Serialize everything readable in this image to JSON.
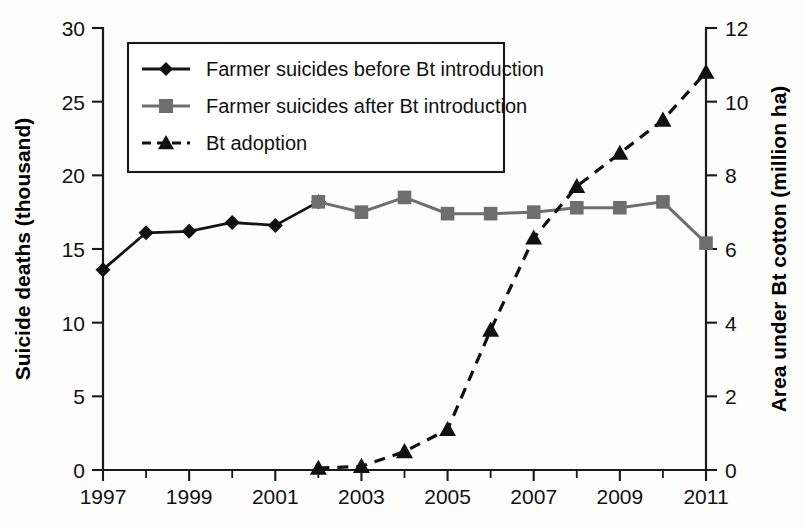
{
  "chart_data": {
    "type": "line",
    "title": "",
    "xlabel": "",
    "ylabel": "Suicide deaths (thousand)",
    "y2label": "Area under Bt cotton (million ha)",
    "x": [
      1997,
      1998,
      1999,
      2000,
      2001,
      2002,
      2003,
      2004,
      2005,
      2006,
      2007,
      2008,
      2009,
      2010,
      2011
    ],
    "xlim": [
      1997,
      2011
    ],
    "ylim": [
      0,
      30
    ],
    "y2lim": [
      0,
      12
    ],
    "xticks": [
      1997,
      1998,
      1999,
      2000,
      2001,
      2002,
      2003,
      2004,
      2005,
      2006,
      2007,
      2008,
      2009,
      2010,
      2011
    ],
    "xticklabels": [
      "1997",
      "",
      "1999",
      "",
      "2001",
      "",
      "2003",
      "",
      "2005",
      "",
      "2007",
      "",
      "2009",
      "",
      "2011"
    ],
    "yticks": [
      0,
      5,
      10,
      15,
      20,
      25,
      30
    ],
    "yticklabels": [
      "0",
      "5",
      "10",
      "15",
      "20",
      "25",
      "30"
    ],
    "y2ticks": [
      0,
      2,
      4,
      6,
      8,
      10,
      12
    ],
    "y2ticklabels": [
      "0",
      "2",
      "4",
      "6",
      "8",
      "10",
      "12"
    ],
    "grid": false,
    "legend_position": "upper-left-inside",
    "series": [
      {
        "name": "Farmer suicides before Bt introduction",
        "axis": "left",
        "marker": "diamond",
        "color": "#141414",
        "linestyle": "solid",
        "x": [
          1997,
          1998,
          1999,
          2000,
          2001,
          2002
        ],
        "values": [
          13.6,
          16.1,
          16.2,
          16.8,
          16.6,
          18.2
        ]
      },
      {
        "name": "Farmer suicides after Bt introduction",
        "axis": "left",
        "marker": "square",
        "color": "#6e6e6e",
        "linestyle": "solid",
        "x": [
          2002,
          2003,
          2004,
          2005,
          2006,
          2007,
          2008,
          2009,
          2010,
          2011
        ],
        "values": [
          18.2,
          17.5,
          18.5,
          17.4,
          17.4,
          17.5,
          17.8,
          17.8,
          18.2,
          15.4
        ]
      },
      {
        "name": "Bt adoption",
        "axis": "right",
        "marker": "triangle",
        "color": "#111111",
        "linestyle": "dashed",
        "x": [
          2002,
          2003,
          2004,
          2005,
          2006,
          2007,
          2008,
          2009,
          2010,
          2011
        ],
        "values": [
          0.05,
          0.1,
          0.5,
          1.1,
          3.8,
          6.3,
          7.7,
          8.6,
          9.5,
          10.8
        ]
      }
    ]
  },
  "legend": {
    "items": [
      {
        "label": "Farmer suicides before Bt introduction",
        "marker": "diamond",
        "color": "#141414",
        "style": "solid"
      },
      {
        "label": "Farmer suicides after Bt introduction",
        "marker": "square",
        "color": "#6e6e6e",
        "style": "solid"
      },
      {
        "label": "Bt adoption",
        "marker": "triangle",
        "color": "#111111",
        "style": "dashed"
      }
    ]
  }
}
